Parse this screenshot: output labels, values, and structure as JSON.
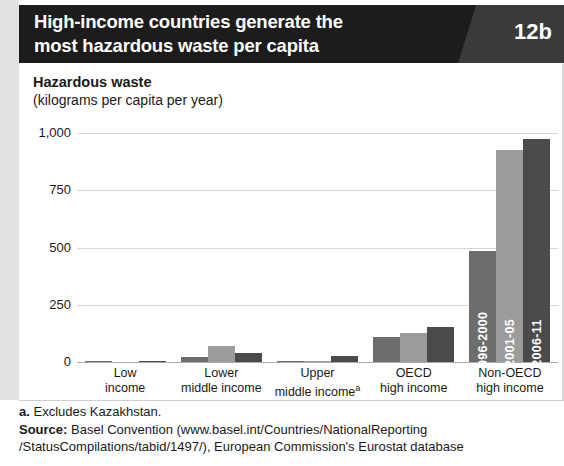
{
  "header": {
    "title_line1": "High-income countries generate the",
    "title_line2": "most hazardous waste per capita",
    "badge": "12b"
  },
  "chart_data": {
    "type": "bar",
    "title": "High-income countries generate the most hazardous waste per capita",
    "axis_title": "Hazardous waste",
    "axis_subtitle": "(kilograms per capita per year)",
    "xlabel": "",
    "ylabel": "Hazardous waste (kilograms per capita per year)",
    "ylim": [
      0,
      1000
    ],
    "yticks": [
      "0",
      "250",
      "500",
      "750",
      "1,000"
    ],
    "ytick_values": [
      0,
      250,
      500,
      750,
      1000
    ],
    "grid": true,
    "legend_position": "in-bars",
    "categories": [
      "Low income",
      "Lower middle income",
      "Upper middle income",
      "OECD high income",
      "Non-OECD high income"
    ],
    "category_lines": [
      [
        "Low",
        "income"
      ],
      [
        "Lower",
        "middle income"
      ],
      [
        "Upper",
        "middle income"
      ],
      [
        "OECD",
        "high income"
      ],
      [
        "Non-OECD",
        "high income"
      ]
    ],
    "series": [
      {
        "name": "1996-2000",
        "color": "#6d6d6d",
        "values": [
          2,
          22,
          5,
          110,
          485
        ]
      },
      {
        "name": "2001-05",
        "color": "#9c9c9c",
        "values": [
          0,
          70,
          2,
          125,
          925
        ]
      },
      {
        "name": "2006-11",
        "color": "#4b4b4b",
        "values": [
          6,
          40,
          26,
          155,
          975
        ]
      }
    ],
    "annotations": [
      "a"
    ]
  },
  "notes": {
    "footnote_marker": "a.",
    "footnote_text": " Excludes Kazakhstan.",
    "source_label": "Source:",
    "source_line1": " Basel Convention (www.basel.int/Countries/NationalReporting",
    "source_line2": "/StatusCompilations/tabid/1497/), European Commission's Eurostat database"
  }
}
